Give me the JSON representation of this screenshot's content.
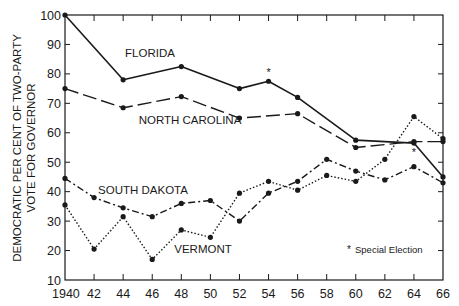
{
  "chart_data": {
    "type": "line",
    "title": "",
    "xlabel": "",
    "ylabel_line1": "DEMOCRATIC PER CENT OF TWO-PARTY",
    "ylabel_line2": "VOTE FOR GOVERNOR",
    "x": [
      1940,
      1942,
      1944,
      1946,
      1948,
      1950,
      1952,
      1954,
      1956,
      1958,
      1960,
      1962,
      1964,
      1966
    ],
    "x_tick_labels": [
      "1940",
      "42",
      "44",
      "46",
      "48",
      "50",
      "52",
      "54",
      "56",
      "58",
      "60",
      "62",
      "64",
      "66"
    ],
    "y_ticks": [
      10,
      20,
      30,
      40,
      50,
      60,
      70,
      80,
      90,
      100
    ],
    "y_tick_labels": [
      "10",
      "20",
      "30",
      "40",
      "50",
      "60",
      "70",
      "80",
      "90",
      "100"
    ],
    "xlim": [
      1940,
      1966
    ],
    "ylim": [
      10,
      100
    ],
    "grid": false,
    "series": [
      {
        "name": "FLORIDA",
        "style": "solid",
        "points": [
          [
            1940,
            100
          ],
          [
            1944,
            78
          ],
          [
            1948,
            82.5
          ],
          [
            1952,
            75
          ],
          [
            1954,
            77.5
          ],
          [
            1956,
            72
          ],
          [
            1960,
            57.5
          ],
          [
            1964,
            56.5
          ],
          [
            1966,
            45
          ]
        ],
        "special_elections": [
          1954
        ],
        "label_pos": [
          150,
          57
        ]
      },
      {
        "name": "NORTH CAROLINA",
        "style": "longdash",
        "points": [
          [
            1940,
            75
          ],
          [
            1944,
            68.5
          ],
          [
            1948,
            72.3
          ],
          [
            1952,
            65
          ],
          [
            1956,
            66.5
          ],
          [
            1960,
            55
          ],
          [
            1964,
            57
          ],
          [
            1966,
            57
          ]
        ],
        "special_elections": [
          1964
        ],
        "label_pos": [
          190,
          124
        ]
      },
      {
        "name": "SOUTH DAKOTA",
        "style": "dashdot",
        "points": [
          [
            1940,
            44.5
          ],
          [
            1942,
            38
          ],
          [
            1944,
            34.5
          ],
          [
            1946,
            31.5
          ],
          [
            1948,
            36
          ],
          [
            1950,
            37
          ],
          [
            1952,
            30
          ],
          [
            1954,
            39.5
          ],
          [
            1956,
            43.5
          ],
          [
            1958,
            51
          ],
          [
            1960,
            47
          ],
          [
            1962,
            44
          ],
          [
            1964,
            48.5
          ],
          [
            1966,
            43
          ]
        ],
        "special_elections": [],
        "label_pos": [
          143,
          194
        ]
      },
      {
        "name": "VERMONT",
        "style": "dotted",
        "points": [
          [
            1940,
            35.5
          ],
          [
            1942,
            20.5
          ],
          [
            1944,
            31.5
          ],
          [
            1946,
            17
          ],
          [
            1948,
            27
          ],
          [
            1950,
            24.5
          ],
          [
            1952,
            39.5
          ],
          [
            1954,
            43.5
          ],
          [
            1956,
            40.5
          ],
          [
            1958,
            45.5
          ],
          [
            1960,
            43.5
          ],
          [
            1962,
            51
          ],
          [
            1964,
            65.5
          ],
          [
            1966,
            58
          ]
        ],
        "special_elections": [],
        "label_pos": [
          203,
          253
        ]
      }
    ],
    "annotations": [
      {
        "text": "* Special Election",
        "position": "lower-right inside plot"
      }
    ],
    "legend": "none (direct labels)"
  },
  "labels": {
    "florida": "FLORIDA",
    "north_carolina": "NORTH CAROLINA",
    "south_dakota": "SOUTH DAKOTA",
    "vermont": "VERMONT",
    "special_note": "Special Election",
    "asterisk": "*"
  }
}
